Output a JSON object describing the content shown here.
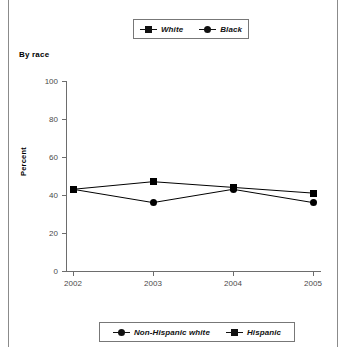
{
  "panel": {
    "title": "By race"
  },
  "legend_top": {
    "entries": [
      {
        "label": "White",
        "marker": "square-marker"
      },
      {
        "label": "Black",
        "marker": "circle-marker"
      }
    ]
  },
  "legend_bottom": {
    "entries": [
      {
        "label": "Non-Hispanic white",
        "marker": "circle-marker"
      },
      {
        "label": "Hispanic",
        "marker": "square-marker"
      }
    ]
  },
  "chart_data": {
    "type": "line",
    "title": "By race",
    "xlabel": "",
    "ylabel": "Percent",
    "categories": [
      "2002",
      "2003",
      "2004",
      "2005"
    ],
    "x": [
      2002,
      2003,
      2004,
      2005
    ],
    "xlim": [
      2002,
      2005
    ],
    "ylim": [
      0,
      100
    ],
    "yticks": [
      0,
      20,
      40,
      60,
      80,
      100
    ],
    "ytick_labels": [
      "0",
      "20",
      "40",
      "60",
      "80",
      "100"
    ],
    "xtick_labels": [
      "2002",
      "2003",
      "2004",
      "2005"
    ],
    "grid": false,
    "legend_position": "above-plot",
    "series": [
      {
        "name": "White",
        "marker": "square",
        "color": "#000000",
        "values": [
          43,
          47,
          44,
          41
        ]
      },
      {
        "name": "Black",
        "marker": "circle",
        "color": "#000000",
        "values": [
          43,
          36,
          43,
          36
        ]
      }
    ]
  }
}
